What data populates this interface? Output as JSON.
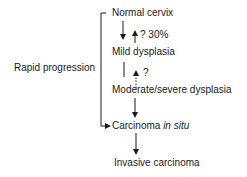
{
  "diagram": {
    "side_label": "Rapid progression",
    "stages": [
      {
        "id": "normal",
        "label": "Normal cervix"
      },
      {
        "id": "mild",
        "label": "Mild dysplasia"
      },
      {
        "id": "moderate",
        "label": "Moderate/severe dysplasia"
      },
      {
        "id": "cis",
        "label_main": "Carcinoma ",
        "label_italic": "in situ"
      },
      {
        "id": "invasive",
        "label": "Invasive carcinoma"
      }
    ],
    "regression_labels": {
      "mild_to_normal": "? 30%",
      "moderate_to_mild": "?"
    }
  }
}
